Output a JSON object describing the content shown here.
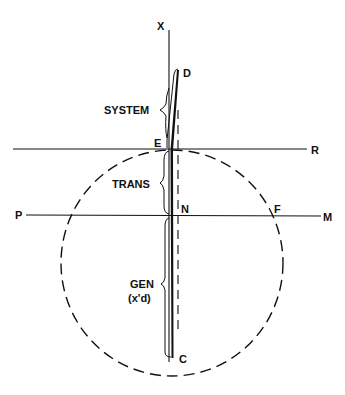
{
  "diagram": {
    "type": "phasor-vector-diagram",
    "labels": {
      "axis_x": "X",
      "point_d": "D",
      "point_e": "E",
      "point_r": "R",
      "point_p": "P",
      "point_n": "N",
      "point_f": "F",
      "point_m": "M",
      "point_c": "C"
    },
    "segments": {
      "system": "SYSTEM",
      "trans": "TRANS",
      "gen_line1": "GEN",
      "gen_line2": "(x'd)"
    },
    "colors": {
      "ink": "#111111",
      "background": "#ffffff"
    }
  }
}
